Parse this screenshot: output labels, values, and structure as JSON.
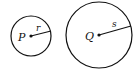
{
  "diagram": {
    "circles": [
      {
        "name": "P",
        "center_label": "P",
        "radius_label": "r",
        "cx": 31,
        "cy": 36,
        "r": 20,
        "radius_end": [
          51,
          31
        ]
      },
      {
        "name": "Q",
        "center_label": "Q",
        "radius_label": "s",
        "cx": 99,
        "cy": 35,
        "r": 33,
        "radius_end": [
          131,
          26
        ]
      }
    ],
    "stroke_color": "#111111",
    "background": "#ffffff"
  }
}
